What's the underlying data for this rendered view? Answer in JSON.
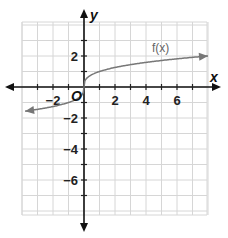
{
  "chart_data": {
    "type": "line",
    "title": "",
    "xlabel": "x",
    "ylabel": "y",
    "origin_label": "O",
    "xlim": [
      -4,
      8
    ],
    "ylim": [
      -8,
      4.2
    ],
    "grid": true,
    "x_ticks": [
      -2,
      2,
      4,
      6
    ],
    "x_tick_labels": [
      "−2",
      "2",
      "4",
      "6"
    ],
    "y_ticks": [
      2,
      -2,
      -4,
      -6
    ],
    "y_tick_labels": [
      "2",
      "−2",
      "−4",
      "−6"
    ],
    "series": [
      {
        "name": "f(x)",
        "label": "f(x)",
        "description": "cube-root-like curve through origin, arrows both ends",
        "x": [
          -3.8,
          -2,
          -1,
          -0.3,
          0,
          0.3,
          1,
          2,
          4,
          6,
          8
        ],
        "y": [
          -1.6,
          -1.25,
          -1.0,
          -0.65,
          0,
          0.65,
          1.0,
          1.25,
          1.6,
          1.8,
          2.0
        ],
        "color": "#777777"
      }
    ]
  }
}
